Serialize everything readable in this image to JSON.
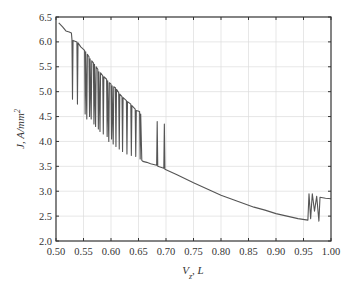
{
  "chart_data": {
    "type": "line",
    "title": "",
    "xlabel": "V_z, L",
    "ylabel": "J, A/mm^2",
    "xlim": [
      0.5,
      1.0
    ],
    "ylim": [
      2.0,
      6.5
    ],
    "grid": true,
    "legend": null,
    "x_ticks": [
      "0.50",
      "0.55",
      "0.60",
      "0.65",
      "0.70",
      "0.75",
      "0.80",
      "0.85",
      "0.90",
      "0.95",
      "1.00"
    ],
    "y_ticks": [
      "2.0",
      "2.5",
      "3.0",
      "3.5",
      "4.0",
      "4.5",
      "5.0",
      "5.5",
      "6.0",
      "6.5"
    ],
    "series": [
      {
        "name": "J",
        "color": "#555555",
        "points": [
          [
            0.505,
            6.38
          ],
          [
            0.512,
            6.3
          ],
          [
            0.518,
            6.22
          ],
          [
            0.524,
            6.2
          ],
          [
            0.528,
            6.18
          ],
          [
            0.529,
            6.05
          ],
          [
            0.53,
            4.85
          ],
          [
            0.531,
            6.03
          ],
          [
            0.538,
            6.0
          ],
          [
            0.539,
            4.75
          ],
          [
            0.54,
            5.98
          ],
          [
            0.545,
            5.9
          ],
          [
            0.552,
            5.83
          ],
          [
            0.553,
            4.55
          ],
          [
            0.554,
            5.8
          ],
          [
            0.556,
            4.45
          ],
          [
            0.557,
            5.75
          ],
          [
            0.56,
            5.7
          ],
          [
            0.561,
            4.5
          ],
          [
            0.562,
            5.66
          ],
          [
            0.564,
            4.45
          ],
          [
            0.565,
            5.62
          ],
          [
            0.568,
            5.58
          ],
          [
            0.569,
            4.35
          ],
          [
            0.57,
            5.55
          ],
          [
            0.572,
            4.3
          ],
          [
            0.573,
            5.5
          ],
          [
            0.576,
            5.45
          ],
          [
            0.577,
            4.25
          ],
          [
            0.578,
            5.4
          ],
          [
            0.58,
            4.2
          ],
          [
            0.581,
            5.38
          ],
          [
            0.585,
            5.32
          ],
          [
            0.586,
            4.15
          ],
          [
            0.587,
            5.3
          ],
          [
            0.592,
            5.25
          ],
          [
            0.593,
            4.1
          ],
          [
            0.594,
            5.22
          ],
          [
            0.596,
            4.0
          ],
          [
            0.597,
            5.18
          ],
          [
            0.6,
            5.15
          ],
          [
            0.601,
            4.05
          ],
          [
            0.602,
            5.12
          ],
          [
            0.604,
            3.95
          ],
          [
            0.605,
            5.1
          ],
          [
            0.608,
            5.08
          ],
          [
            0.609,
            3.9
          ],
          [
            0.61,
            5.05
          ],
          [
            0.614,
            4.98
          ],
          [
            0.615,
            3.85
          ],
          [
            0.616,
            4.95
          ],
          [
            0.62,
            4.9
          ],
          [
            0.621,
            3.8
          ],
          [
            0.622,
            4.88
          ],
          [
            0.628,
            4.82
          ],
          [
            0.629,
            3.75
          ],
          [
            0.63,
            4.8
          ],
          [
            0.636,
            4.75
          ],
          [
            0.637,
            3.72
          ],
          [
            0.638,
            4.72
          ],
          [
            0.644,
            4.65
          ],
          [
            0.645,
            3.7
          ],
          [
            0.646,
            4.62
          ],
          [
            0.652,
            4.6
          ],
          [
            0.653,
            3.65
          ],
          [
            0.654,
            4.55
          ],
          [
            0.656,
            3.62
          ],
          [
            0.658,
            3.6
          ],
          [
            0.665,
            3.58
          ],
          [
            0.672,
            3.55
          ],
          [
            0.683,
            3.52
          ],
          [
            0.684,
            4.4
          ],
          [
            0.685,
            3.5
          ],
          [
            0.696,
            3.46
          ],
          [
            0.697,
            4.35
          ],
          [
            0.698,
            3.44
          ],
          [
            0.72,
            3.33
          ],
          [
            0.75,
            3.17
          ],
          [
            0.78,
            3.02
          ],
          [
            0.8,
            2.92
          ],
          [
            0.83,
            2.8
          ],
          [
            0.86,
            2.68
          ],
          [
            0.88,
            2.62
          ],
          [
            0.9,
            2.55
          ],
          [
            0.92,
            2.5
          ],
          [
            0.94,
            2.45
          ],
          [
            0.958,
            2.42
          ],
          [
            0.96,
            2.95
          ],
          [
            0.963,
            2.45
          ],
          [
            0.966,
            2.95
          ],
          [
            0.97,
            2.6
          ],
          [
            0.974,
            2.9
          ],
          [
            0.978,
            2.4
          ],
          [
            0.98,
            2.88
          ],
          [
            0.99,
            2.86
          ],
          [
            1.0,
            2.85
          ]
        ]
      }
    ]
  }
}
